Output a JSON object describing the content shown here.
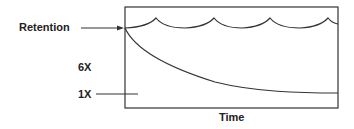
{
  "diagram": {
    "labels": {
      "retention": "Retention",
      "six_x": "6X",
      "one_x": "1X",
      "x_axis": "Time"
    },
    "colors": {
      "stroke": "#333333",
      "text": "#222222",
      "background": "#ffffff"
    },
    "curves": {
      "retention_scallops": {
        "description": "periodic scalloped line near top representing retention refreshed over time",
        "peaks_x": [
          156,
          214,
          270,
          328
        ]
      },
      "decay": {
        "description": "decaying curve from retention level down toward 1X level",
        "start": [
          125,
          28
        ],
        "end": [
          338,
          93
        ]
      }
    }
  }
}
